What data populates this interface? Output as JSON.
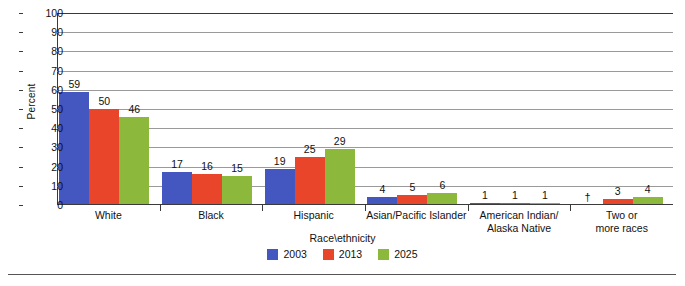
{
  "chart_data": {
    "type": "bar",
    "title": "",
    "xlabel": "Race\\ethnicity",
    "ylabel": "Percent",
    "ylim": [
      0,
      100
    ],
    "ytick_step": 10,
    "yticks": [
      "100",
      "90",
      "80",
      "70",
      "60",
      "50",
      "40",
      "30",
      "20",
      "10",
      "0"
    ],
    "grid": true,
    "legend_position": "bottom-center",
    "categories": [
      "White",
      "Black",
      "Hispanic",
      "Asian/Pacific Islander",
      "American Indian/\nAlaska Native",
      "Two or\nmore races"
    ],
    "series": [
      {
        "name": "2003",
        "color": "#4456bf",
        "values": [
          59,
          17,
          19,
          4,
          1,
          null
        ],
        "labels": [
          "59",
          "17",
          "19",
          "4",
          "1",
          "†"
        ]
      },
      {
        "name": "2013",
        "color": "#e8452a",
        "values": [
          50,
          16,
          25,
          5,
          1,
          3
        ],
        "labels": [
          "50",
          "16",
          "25",
          "5",
          "1",
          "3"
        ]
      },
      {
        "name": "2025",
        "color": "#8cb83c",
        "values": [
          46,
          15,
          29,
          6,
          1,
          4
        ],
        "labels": [
          "46",
          "15",
          "29",
          "6",
          "1",
          "4"
        ]
      }
    ]
  },
  "legend": {
    "title": "Race\\ethnicity",
    "items": [
      {
        "label": "2003",
        "color": "#4456bf"
      },
      {
        "label": "2013",
        "color": "#e8452a"
      },
      {
        "label": "2025",
        "color": "#8cb83c"
      }
    ]
  },
  "axes": {
    "y_title": "Percent",
    "x_title": "Race\\ethnicity"
  }
}
